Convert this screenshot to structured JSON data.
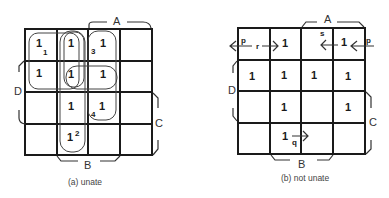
{
  "maps": [
    {
      "id": "a",
      "caption": "(a) unate",
      "labels": {
        "A": "A",
        "B": "B",
        "C": "C",
        "D": "D"
      },
      "cells": [
        {
          "row": 0,
          "col": 0,
          "value": "1"
        },
        {
          "row": 0,
          "col": 1,
          "value": "1"
        },
        {
          "row": 0,
          "col": 2,
          "value": "1"
        },
        {
          "row": 1,
          "col": 0,
          "value": "1"
        },
        {
          "row": 1,
          "col": 1,
          "value": "1"
        },
        {
          "row": 1,
          "col": 2,
          "value": "1"
        },
        {
          "row": 2,
          "col": 1,
          "value": "1"
        },
        {
          "row": 2,
          "col": 2,
          "value": "1"
        },
        {
          "row": 3,
          "col": 1,
          "value": "1"
        }
      ],
      "loop_numbers": [
        "1",
        "2",
        "3",
        "4"
      ]
    },
    {
      "id": "b",
      "caption": "(b) not unate",
      "labels": {
        "A": "A",
        "B": "B",
        "C": "C",
        "D": "D"
      },
      "cells": [
        {
          "row": 0,
          "col": 1,
          "value": "1"
        },
        {
          "row": 0,
          "col": 3,
          "value": "1"
        },
        {
          "row": 1,
          "col": 0,
          "value": "1"
        },
        {
          "row": 1,
          "col": 1,
          "value": "1"
        },
        {
          "row": 1,
          "col": 2,
          "value": "1"
        },
        {
          "row": 1,
          "col": 3,
          "value": "1"
        },
        {
          "row": 2,
          "col": 1,
          "value": "1"
        },
        {
          "row": 2,
          "col": 3,
          "value": "1"
        },
        {
          "row": 3,
          "col": 1,
          "value": "1"
        }
      ],
      "arrow_labels": {
        "p_left": "p",
        "p_right": "p",
        "r": "r",
        "s": "s",
        "q": "q"
      }
    }
  ]
}
